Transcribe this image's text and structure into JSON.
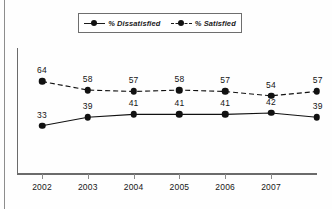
{
  "legend": {
    "entries": [
      {
        "label": "% Dissatisfied",
        "style": "solid",
        "marker": "filled-circle",
        "color": "#111111"
      },
      {
        "label": "% Satisfied",
        "style": "dashed",
        "marker": "filled-circle",
        "color": "#111111"
      }
    ]
  },
  "chart_data": {
    "type": "line",
    "title": "",
    "subtitle": "",
    "xlabel": "",
    "ylabel": "",
    "grid": false,
    "legend_position": "top",
    "categories": [
      "2002",
      "2003",
      "2004",
      "2005",
      "2006",
      "2007",
      ""
    ],
    "tick_labels": [
      "2002",
      "2003",
      "2004",
      "2005",
      "2006",
      "2007"
    ],
    "ylim": [
      0,
      70
    ],
    "series": [
      {
        "name": "% Satisfied",
        "style": "dashed",
        "color": "#111111",
        "values": [
          64,
          58,
          57,
          58,
          57,
          54,
          57
        ],
        "labels": [
          "64",
          "58",
          "57",
          "58",
          "57",
          "54",
          "57"
        ]
      },
      {
        "name": "% Dissatisfied",
        "style": "solid",
        "color": "#111111",
        "values": [
          33,
          39,
          41,
          41,
          41,
          42,
          39
        ],
        "labels": [
          "33",
          "39",
          "41",
          "41",
          "41",
          "42",
          "39"
        ]
      }
    ]
  }
}
